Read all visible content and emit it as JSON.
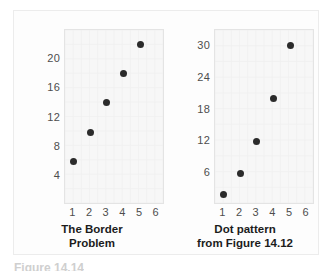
{
  "figure": {
    "footer_text": "Figure 14.14",
    "dot_color": "#2b2b2b",
    "panel_color": "#f7f7f7"
  },
  "chart_data": [
    {
      "type": "scatter",
      "title": "The Border Problem",
      "caption_lines": [
        "The Border",
        "Problem"
      ],
      "xlabel": "",
      "ylabel": "",
      "x": [
        1,
        2,
        3,
        4,
        5
      ],
      "values": [
        6,
        10,
        14,
        18,
        22
      ],
      "categories": [
        "1",
        "2",
        "3",
        "4",
        "5"
      ],
      "xticks": [
        "1",
        "2",
        "3",
        "4",
        "5",
        "6"
      ],
      "yticks": [
        "4",
        "8",
        "12",
        "16",
        "20"
      ],
      "xlim": [
        0.5,
        6.5
      ],
      "ylim": [
        0,
        24
      ],
      "grid": true,
      "legend": "none"
    },
    {
      "type": "scatter",
      "title": "Dot pattern from Figure 14.12",
      "caption_lines": [
        "Dot pattern",
        "from Figure 14.12"
      ],
      "xlabel": "",
      "ylabel": "",
      "x": [
        1,
        2,
        3,
        4,
        5
      ],
      "values": [
        2,
        6,
        12,
        20,
        30
      ],
      "categories": [
        "1",
        "2",
        "3",
        "4",
        "5"
      ],
      "xticks": [
        "1",
        "2",
        "3",
        "4",
        "5",
        "6"
      ],
      "yticks": [
        "6",
        "12",
        "18",
        "24",
        "30"
      ],
      "xlim": [
        0.5,
        6.5
      ],
      "ylim": [
        0,
        33
      ],
      "grid": true,
      "legend": "none"
    }
  ]
}
